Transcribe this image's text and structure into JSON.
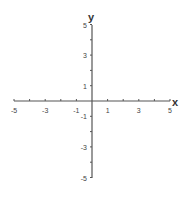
{
  "chart_data": {
    "type": "line",
    "title": "",
    "xlabel": "x",
    "ylabel": "y",
    "xlim": [
      -5,
      5
    ],
    "ylim": [
      -5,
      5
    ],
    "grid": false,
    "x_ticks": [
      -5,
      -4,
      -3,
      -2,
      -1,
      0,
      1,
      2,
      3,
      4,
      5
    ],
    "y_ticks": [
      -5,
      -4,
      -3,
      -2,
      -1,
      0,
      1,
      2,
      3,
      4,
      5
    ],
    "x_tick_labels": [
      "-5",
      "-3",
      "-1",
      "1",
      "3",
      "5"
    ],
    "y_tick_labels": [
      "5",
      "3",
      "1",
      "-1",
      "-3",
      "-5"
    ],
    "series": []
  },
  "axes": {
    "x_label": "x",
    "y_label": "y",
    "color": "#555555"
  }
}
